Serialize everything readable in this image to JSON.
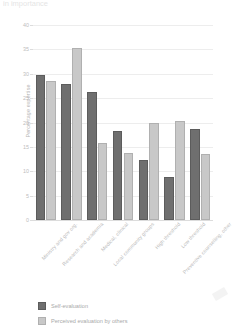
{
  "title": "in importance",
  "chart_data": {
    "type": "bar",
    "title": "in importance",
    "xlabel": "",
    "ylabel": "Percentage expertise",
    "ylim": [
      0,
      40
    ],
    "yticks": [
      0,
      5,
      10,
      15,
      20,
      25,
      30,
      35,
      40
    ],
    "grid": true,
    "legend_position": "bottom-left",
    "categories": [
      "Ministry and gov org.",
      "Research and academia",
      "Medical, clinical",
      "Local community groups",
      "High threshold",
      "Low threshold",
      "Preventive counselling, other"
    ],
    "series": [
      {
        "name": "Self-evaluation",
        "color": "#6f6f6f",
        "values": [
          29.7,
          27.8,
          26.3,
          18.2,
          12.4,
          8.9,
          18.6
        ]
      },
      {
        "name": "Perceived evaluation by others",
        "color": "#c8c8c8",
        "values": [
          28.5,
          35.2,
          15.9,
          13.7,
          19.9,
          20.4,
          13.6
        ]
      }
    ]
  },
  "legend": {
    "items": [
      {
        "label": "Self-evaluation",
        "swatch": "self"
      },
      {
        "label": "Perceived evaluation by others",
        "swatch": "other"
      }
    ]
  }
}
